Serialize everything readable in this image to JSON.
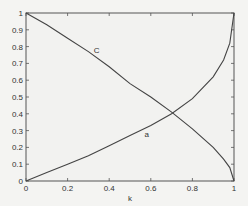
{
  "chart_data": {
    "type": "line",
    "title": "",
    "xlabel": "k",
    "ylabel": "",
    "xlim": [
      0,
      1
    ],
    "ylim": [
      0,
      1
    ],
    "grid": false,
    "legend": "none (inline curve labels)",
    "x_ticks": [
      "0",
      "0.2",
      "0.4",
      "0.6",
      "0.8",
      "1"
    ],
    "y_ticks": [
      "0",
      "0.1",
      "0.2",
      "0.3",
      "0.4",
      "0.5",
      "0.6",
      "0.7",
      "0.8",
      "0.9",
      "1"
    ],
    "x": [
      0,
      0.1,
      0.2,
      0.3,
      0.4,
      0.5,
      0.6,
      0.7,
      0.8,
      0.9,
      0.95,
      0.98,
      1.0
    ],
    "series": [
      {
        "name": "C",
        "values": [
          1.0,
          0.93,
          0.85,
          0.77,
          0.68,
          0.58,
          0.5,
          0.41,
          0.31,
          0.2,
          0.13,
          0.08,
          0.0
        ]
      },
      {
        "name": "a",
        "values": [
          0.0,
          0.05,
          0.1,
          0.15,
          0.21,
          0.27,
          0.33,
          0.4,
          0.49,
          0.62,
          0.72,
          0.82,
          1.0
        ]
      }
    ],
    "annotations": [
      {
        "text": "C",
        "x": 0.34,
        "y": 0.76
      },
      {
        "text": "a",
        "x": 0.58,
        "y": 0.26
      }
    ],
    "intersection": {
      "x": 0.7,
      "y": 0.41
    }
  }
}
